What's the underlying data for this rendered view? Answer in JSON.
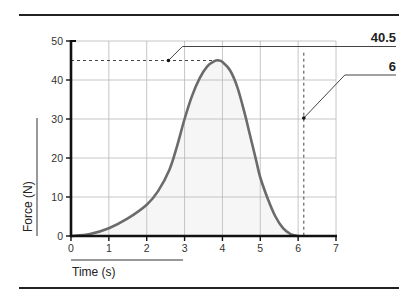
{
  "chart_data": {
    "type": "line",
    "title": "",
    "xlabel": "Time (s)",
    "ylabel": "Force (N)",
    "xlim": [
      0,
      7
    ],
    "ylim": [
      0,
      50
    ],
    "xticks": [
      0,
      1,
      2,
      3,
      4,
      5,
      6,
      7
    ],
    "yticks": [
      0,
      10,
      20,
      30,
      40,
      50
    ],
    "grid": true,
    "legend": null,
    "series": [
      {
        "name": "Force curve",
        "x": [
          0,
          0.5,
          1,
          1.5,
          2,
          2.3,
          2.6,
          2.8,
          3.0,
          3.2,
          3.4,
          3.6,
          3.8,
          3.9,
          4.0,
          4.2,
          4.4,
          4.6,
          4.7,
          4.8,
          4.9,
          5.0,
          5.2,
          5.4,
          5.6,
          5.8,
          6.0
        ],
        "y": [
          0,
          0.5,
          2,
          4.5,
          8,
          11.5,
          17,
          23,
          30,
          36,
          40.5,
          43.5,
          44.9,
          45,
          44.6,
          42.5,
          38,
          31,
          27,
          23,
          19,
          15,
          9.5,
          5,
          2,
          0.5,
          0
        ]
      }
    ],
    "annotations": [
      {
        "label": "40.5",
        "type": "horizontal-dashed",
        "y": 45,
        "x_range": [
          0,
          3.9
        ],
        "pointer_at": [
          2.6,
          45
        ]
      },
      {
        "label": "6",
        "type": "vertical-dashed",
        "x": 6.15,
        "y_range": [
          0,
          47
        ],
        "pointer_at": [
          6.15,
          30
        ]
      }
    ],
    "shaded_area_under_curve": true
  },
  "labels": {
    "x_axis": "Time (s)",
    "y_axis": "Force (N)",
    "annotation_peak": "40.5",
    "annotation_time": "6"
  },
  "colors": {
    "curve": "#6b6b6b",
    "axis": "#111111",
    "grid": "#b8b8b8",
    "fill": "#f6f6f6",
    "rule": "#222222"
  }
}
